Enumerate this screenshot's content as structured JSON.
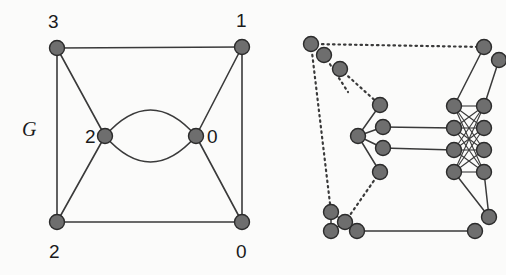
{
  "figure": {
    "name": "graph-expansion-figure",
    "width": 506,
    "height": 275,
    "background_color": "#fbfbfa"
  },
  "style": {
    "node_fill": "#6e6e6e",
    "node_stroke": "#2b2b2b",
    "edge_color": "#3a3a3a",
    "label_color": "#1a1a1a",
    "node_radius_left": 7.5,
    "node_radius_right": 7.5,
    "edge_width_left": 1.6,
    "edge_width_right": 1.5,
    "dotted_dasharray": "1.5 4"
  },
  "left_graph": {
    "caption": "G",
    "caption_position": {
      "x": 22,
      "y": 136
    },
    "nodes": [
      {
        "id": "tl",
        "label": "3",
        "x": 57,
        "y": 48,
        "label_x": 48,
        "label_y": 28
      },
      {
        "id": "tr",
        "label": "1",
        "x": 242,
        "y": 47,
        "label_x": 236,
        "label_y": 27
      },
      {
        "id": "ml",
        "label": "2",
        "x": 105,
        "y": 136,
        "label_x": 85,
        "label_y": 143
      },
      {
        "id": "mr",
        "label": "0",
        "x": 196,
        "y": 136,
        "label_x": 207,
        "label_y": 143
      },
      {
        "id": "bl",
        "label": "2",
        "x": 57,
        "y": 222,
        "label_x": 49,
        "label_y": 258
      },
      {
        "id": "br",
        "label": "0",
        "x": 242,
        "y": 222,
        "label_x": 236,
        "label_y": 258
      }
    ],
    "straight_edges": [
      {
        "from": "tl",
        "to": "tr",
        "note": "top side"
      },
      {
        "from": "tl",
        "to": "bl",
        "note": "left side"
      },
      {
        "from": "tr",
        "to": "br",
        "note": "right side"
      },
      {
        "from": "bl",
        "to": "br",
        "note": "bottom side"
      },
      {
        "from": "tl",
        "to": "ml",
        "note": "top-left to center-left"
      },
      {
        "from": "ml",
        "to": "bl",
        "note": "center-left to bottom-left"
      },
      {
        "from": "tr",
        "to": "mr",
        "note": "top-right to center-right"
      },
      {
        "from": "mr",
        "to": "br",
        "note": "center-right to bottom-right"
      }
    ],
    "curved_edges": [
      {
        "from": "ml",
        "to": "mr",
        "bow": -26,
        "note": "upper arc of double edge"
      },
      {
        "from": "ml",
        "to": "mr",
        "bow": 26,
        "note": "lower arc of double edge"
      }
    ]
  },
  "right_graph": {
    "caption": "",
    "clusters": [
      {
        "id": "cluster-top-left",
        "note": "three nodes in a diagonal cluster, upper left",
        "nodes": [
          {
            "id": "tl-a",
            "x": 340,
            "y": 69
          },
          {
            "id": "tl-b",
            "x": 324,
            "y": 55
          },
          {
            "id": "tl-c",
            "x": 311,
            "y": 44
          }
        ]
      },
      {
        "id": "cluster-top-right",
        "note": "two stacked nodes, upper right, partly clipped",
        "nodes": [
          {
            "id": "tr-a",
            "x": 484,
            "y": 47
          },
          {
            "id": "tr-b",
            "x": 499,
            "y": 60
          }
        ]
      },
      {
        "id": "cluster-left-fan",
        "note": "hub with four fanned-out nodes on the right",
        "nodes": [
          {
            "id": "hub",
            "x": 358,
            "y": 136
          },
          {
            "id": "fan-1",
            "x": 380,
            "y": 105
          },
          {
            "id": "fan-2",
            "x": 383,
            "y": 127
          },
          {
            "id": "fan-3",
            "x": 383,
            "y": 148
          },
          {
            "id": "fan-4",
            "x": 380,
            "y": 172
          }
        ]
      },
      {
        "id": "cluster-center-right",
        "note": "two columns of four nodes joined by many crossing edges",
        "left_column": [
          {
            "id": "cL-1",
            "x": 454,
            "y": 106
          },
          {
            "id": "cL-2",
            "x": 454,
            "y": 128
          },
          {
            "id": "cL-3",
            "x": 454,
            "y": 150
          },
          {
            "id": "cL-4",
            "x": 454,
            "y": 172
          }
        ],
        "right_column": [
          {
            "id": "cR-1",
            "x": 484,
            "y": 106
          },
          {
            "id": "cR-2",
            "x": 484,
            "y": 128
          },
          {
            "id": "cR-3",
            "x": 484,
            "y": 150
          },
          {
            "id": "cR-4",
            "x": 484,
            "y": 172
          }
        ]
      },
      {
        "id": "cluster-bottom-left",
        "note": "triangle-ish cluster of four nodes at lower left",
        "nodes": [
          {
            "id": "bl-a",
            "x": 331,
            "y": 212
          },
          {
            "id": "bl-b",
            "x": 331,
            "y": 231
          },
          {
            "id": "bl-c",
            "x": 345,
            "y": 222
          },
          {
            "id": "bl-d",
            "x": 357,
            "y": 231
          }
        ]
      },
      {
        "id": "cluster-bottom-right",
        "note": "two nodes at lower right, partly clipped",
        "nodes": [
          {
            "id": "br-a",
            "x": 489,
            "y": 217
          },
          {
            "id": "br-b",
            "x": 475,
            "y": 231
          }
        ]
      }
    ],
    "solid_edges": [
      {
        "from": "hub",
        "to": "fan-1"
      },
      {
        "from": "hub",
        "to": "fan-2"
      },
      {
        "from": "hub",
        "to": "fan-3"
      },
      {
        "from": "hub",
        "to": "fan-4"
      },
      {
        "from": "fan-2",
        "to": "cL-2"
      },
      {
        "from": "fan-3",
        "to": "cL-3"
      },
      {
        "from": "bl-d",
        "to": "br-b"
      },
      {
        "from": "bl-a",
        "to": "bl-b"
      },
      {
        "from": "bl-b",
        "to": "bl-c"
      },
      {
        "from": "bl-c",
        "to": "bl-d"
      },
      {
        "from": "bl-a",
        "to": "bl-c"
      },
      {
        "from": "tr-a",
        "to": "cL-1"
      },
      {
        "from": "tr-b",
        "to": "cR-1"
      },
      {
        "from": "cL-4",
        "to": "br-a"
      },
      {
        "from": "cR-4",
        "to": "br-a"
      }
    ],
    "dotted_edges": [
      {
        "from": "tl-c",
        "to": "tr-a",
        "note": "long dotted top edge"
      },
      {
        "from": "tl-a",
        "to": "fan-1",
        "note": "dotted diagonal into fan"
      },
      {
        "from": "tl-b",
        "to": "hub-area",
        "note": "dotted short link"
      },
      {
        "from": "tl-c",
        "to": "bl-a",
        "note": "long dotted left side"
      },
      {
        "from": "fan-4",
        "to": "bl-c",
        "note": "dotted diagonal to bottom cluster"
      }
    ],
    "bipartite_crossing": {
      "note": "every left-column node joins every right-column node",
      "left_ids": [
        "cL-1",
        "cL-2",
        "cL-3",
        "cL-4"
      ],
      "right_ids": [
        "cR-1",
        "cR-2",
        "cR-3",
        "cR-4"
      ]
    }
  }
}
